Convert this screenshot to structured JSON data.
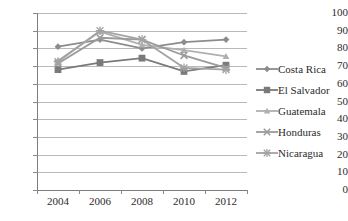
{
  "chart_data": {
    "type": "line",
    "title": "",
    "xlabel": "",
    "ylabel": "",
    "categories": [
      "2004",
      "2006",
      "2008",
      "2010",
      "2012"
    ],
    "ylim": [
      0,
      100
    ],
    "yticks": [
      "0",
      "10",
      "20",
      "30",
      "40",
      "50",
      "60",
      "70",
      "80",
      "90",
      "100"
    ],
    "grid": true,
    "legend_position": "right",
    "series": [
      {
        "name": "Costa Rica",
        "marker": "diamond",
        "color": "#8c8c8c",
        "values": [
          81.0,
          85.0,
          80.0,
          83.5,
          85.0
        ]
      },
      {
        "name": "El Salvador",
        "marker": "square",
        "color": "#7a7a7a",
        "values": [
          68.0,
          72.0,
          74.5,
          67.0,
          70.5
        ]
      },
      {
        "name": "Guatemala",
        "marker": "triangle",
        "color": "#b0b0b0",
        "values": [
          73.0,
          89.5,
          82.0,
          79.0,
          75.5
        ]
      },
      {
        "name": "Honduras",
        "marker": "cross",
        "color": "#9a9a9a",
        "values": [
          71.5,
          86.0,
          85.0,
          76.0,
          69.0
        ]
      },
      {
        "name": "Nicaragua",
        "marker": "star",
        "color": "#a3a3a3",
        "values": [
          72.5,
          90.0,
          85.0,
          69.0,
          68.0
        ]
      }
    ]
  },
  "legend": {
    "items": [
      {
        "label": "Costa Rica"
      },
      {
        "label": "El Salvador"
      },
      {
        "label": "Guatemala"
      },
      {
        "label": "Honduras"
      },
      {
        "label": "Nicaragua"
      }
    ]
  }
}
